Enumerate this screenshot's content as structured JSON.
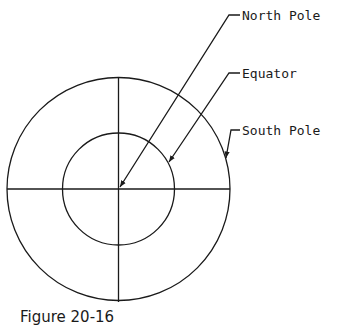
{
  "diagram": {
    "labels": {
      "north_pole": "North Pole",
      "equator": "Equator",
      "south_pole": "South Pole"
    },
    "caption": "Figure 20-16"
  }
}
